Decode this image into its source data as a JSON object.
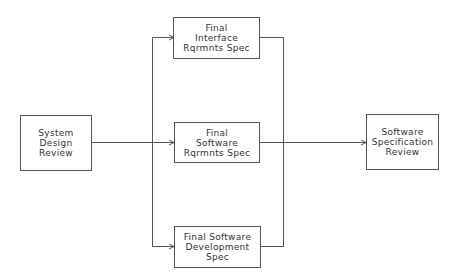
{
  "diagram": {
    "nodes": [
      {
        "id": "sdr",
        "lines": [
          "System",
          "Design",
          "Review"
        ]
      },
      {
        "id": "firs",
        "lines": [
          "Final",
          "Interface",
          "Rqrmnts Spec"
        ]
      },
      {
        "id": "fsrs",
        "lines": [
          "Final",
          "Software",
          "Rqrmnts Spec"
        ]
      },
      {
        "id": "fsds",
        "lines": [
          "Final Software",
          "Development",
          "Spec"
        ]
      },
      {
        "id": "ssr",
        "lines": [
          "Software",
          "Specification",
          "Review"
        ]
      }
    ],
    "edges": [
      {
        "from": "System Design Review",
        "to": "Final Interface Rqrmnts Spec"
      },
      {
        "from": "System Design Review",
        "to": "Final Software Rqrmnts Spec"
      },
      {
        "from": "System Design Review",
        "to": "Final Software Development Spec"
      },
      {
        "from": "Final Interface Rqrmnts Spec",
        "to": "Software Specification Review"
      },
      {
        "from": "Final Software Rqrmnts Spec",
        "to": "Software Specification Review"
      },
      {
        "from": "Final Software Development Spec",
        "to": "Software Specification Review"
      }
    ],
    "colors": {
      "line": "#555555",
      "text": "#333333",
      "background": "#ffffff"
    }
  }
}
